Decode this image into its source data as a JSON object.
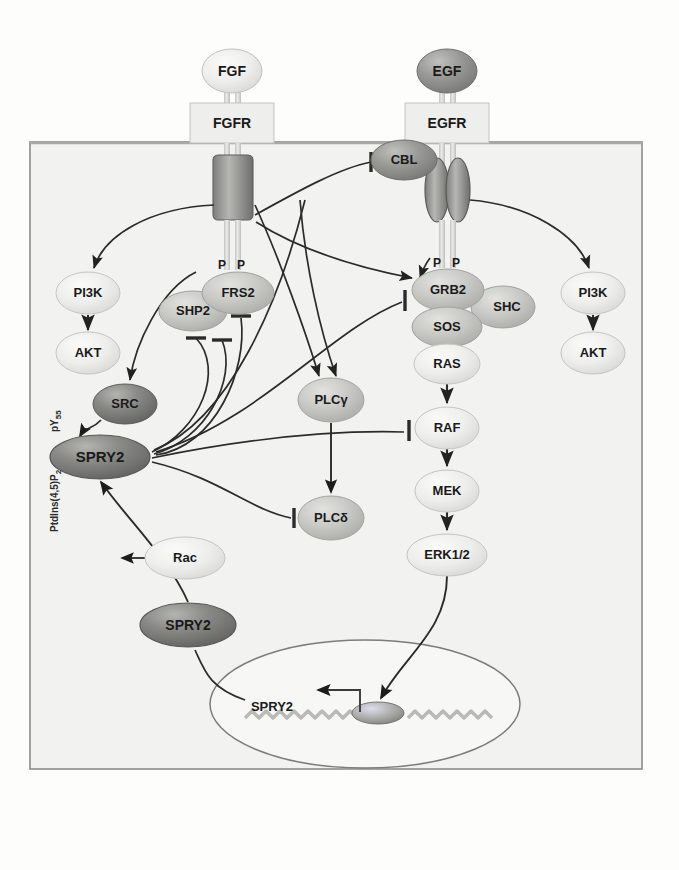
{
  "figure": {
    "membrane_label": "plasma-membrane",
    "cell_label": "cell-body",
    "nucleus_label": "nucleus"
  },
  "colors": {
    "background": "#fdfdfc",
    "cell_fill": "#f2f2f0",
    "cell_border": "#8c8c8c",
    "membrane": "#a8a8a6",
    "node_light": "#e9e9e7",
    "node_mid": "#c9c9c6",
    "node_dark": "#8f8f8d",
    "node_darker": "#6e6e6c",
    "line": "#2b2b2b",
    "text": "#1a1a1a",
    "dna": "#b9b9b6",
    "nucleus_fill": "#f7f7f5"
  },
  "ligands": [
    {
      "id": "fgf",
      "label": "FGF",
      "shade": "light",
      "x": 232,
      "y": 71,
      "rx": 30,
      "ry": 22
    },
    {
      "id": "egf",
      "label": "EGF",
      "shade": "dark",
      "x": 447,
      "y": 71,
      "rx": 30,
      "ry": 22
    }
  ],
  "receptors": [
    {
      "id": "fgfr",
      "label": "FGFR",
      "x": 232,
      "y": 123,
      "w": 84,
      "h": 40
    },
    {
      "id": "egfr",
      "label": "EGFR",
      "x": 447,
      "y": 123,
      "w": 84,
      "h": 40
    }
  ],
  "phospho_marks": [
    {
      "id": "fgfr-p1",
      "label": "P",
      "x": 222,
      "y": 266
    },
    {
      "id": "fgfr-p2",
      "label": "P",
      "x": 241,
      "y": 266
    },
    {
      "id": "egfr-p1",
      "label": "P",
      "x": 437,
      "y": 264
    },
    {
      "id": "egfr-p2",
      "label": "P",
      "x": 456,
      "y": 264
    }
  ],
  "nodes": [
    {
      "id": "cbl",
      "label": "CBL",
      "shade": "dark",
      "x": 404,
      "y": 160,
      "rx": 33,
      "ry": 20
    },
    {
      "id": "pi3k-left",
      "label": "PI3K",
      "shade": "light",
      "x": 88,
      "y": 293,
      "rx": 32,
      "ry": 21
    },
    {
      "id": "akt-left",
      "label": "AKT",
      "shade": "light",
      "x": 88,
      "y": 353,
      "rx": 32,
      "ry": 21
    },
    {
      "id": "src",
      "label": "SRC",
      "shade": "darker",
      "x": 125,
      "y": 404,
      "rx": 32,
      "ry": 20
    },
    {
      "id": "spry2-membrane",
      "label": "SPRY2",
      "shade": "darker",
      "x": 100,
      "y": 457,
      "rx": 50,
      "ry": 22
    },
    {
      "id": "shp2",
      "label": "SHP2",
      "shade": "mid",
      "x": 193,
      "y": 311,
      "rx": 34,
      "ry": 20
    },
    {
      "id": "frs2",
      "label": "FRS2",
      "shade": "mid",
      "x": 238,
      "y": 293,
      "rx": 36,
      "ry": 21
    },
    {
      "id": "plcg",
      "label": "PLCγ",
      "shade": "mid",
      "x": 331,
      "y": 400,
      "rx": 33,
      "ry": 22
    },
    {
      "id": "plcd",
      "label": "PLCδ",
      "shade": "mid",
      "x": 331,
      "y": 518,
      "rx": 33,
      "ry": 22
    },
    {
      "id": "grb2",
      "label": "GRB2",
      "shade": "mid",
      "x": 448,
      "y": 290,
      "rx": 36,
      "ry": 21
    },
    {
      "id": "shc",
      "label": "SHC",
      "shade": "mid",
      "x": 503,
      "y": 307,
      "rx": 32,
      "ry": 21
    },
    {
      "id": "sos",
      "label": "SOS",
      "shade": "mid",
      "x": 447,
      "y": 327,
      "rx": 35,
      "ry": 20
    },
    {
      "id": "ras",
      "label": "RAS",
      "shade": "light",
      "x": 447,
      "y": 364,
      "rx": 33,
      "ry": 20
    },
    {
      "id": "raf",
      "label": "RAF",
      "shade": "light",
      "x": 447,
      "y": 428,
      "rx": 32,
      "ry": 21
    },
    {
      "id": "mek",
      "label": "MEK",
      "shade": "light",
      "x": 447,
      "y": 491,
      "rx": 32,
      "ry": 21
    },
    {
      "id": "erk",
      "label": "ERK1/2",
      "shade": "light",
      "x": 447,
      "y": 555,
      "rx": 40,
      "ry": 21
    },
    {
      "id": "pi3k-right",
      "label": "PI3K",
      "shade": "light",
      "x": 593,
      "y": 293,
      "rx": 32,
      "ry": 21
    },
    {
      "id": "akt-right",
      "label": "AKT",
      "shade": "light",
      "x": 593,
      "y": 353,
      "rx": 32,
      "ry": 21
    },
    {
      "id": "rac",
      "label": "Rac",
      "shade": "light",
      "x": 185,
      "y": 558,
      "rx": 40,
      "ry": 21
    },
    {
      "id": "spry2-cytosol",
      "label": "SPRY2",
      "shade": "darker",
      "x": 188,
      "y": 625,
      "rx": 48,
      "ry": 22
    }
  ],
  "annotations": {
    "ptdins_label": "PtdIns(4,5)P",
    "ptdins_sub": "2",
    "py55_label": "pY",
    "py55_sub": "55",
    "nucleus_gene_label": "SPRY2"
  },
  "legend_semantics": {
    "arrow": "activation",
    "bar": "inhibition"
  }
}
